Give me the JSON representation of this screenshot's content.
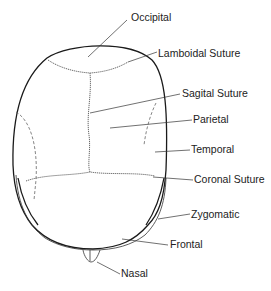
{
  "diagram": {
    "labels": [
      {
        "id": "occipital",
        "text": "Occipital"
      },
      {
        "id": "lamboidal-suture",
        "text": "Lamboidal Suture"
      },
      {
        "id": "sagital-suture",
        "text": "Sagital Suture"
      },
      {
        "id": "parietal",
        "text": "Parietal"
      },
      {
        "id": "temporal",
        "text": "Temporal"
      },
      {
        "id": "coronal-suture",
        "text": "Coronal Suture"
      },
      {
        "id": "zygomatic",
        "text": "Zygomatic"
      },
      {
        "id": "frontal",
        "text": "Frontal"
      },
      {
        "id": "nasal",
        "text": "Nasal"
      }
    ]
  }
}
